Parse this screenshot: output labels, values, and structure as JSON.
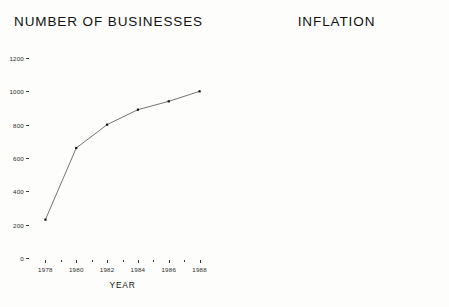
{
  "page": {
    "background_color": "#fdfdfb",
    "ink_color": "#1a1a1a"
  },
  "charts": {
    "left": {
      "title": "NUMBER OF BUSINESSES",
      "xlabel": "YEAR",
      "ylabel": ""
    },
    "right": {
      "title": "INFLATION",
      "xlabel": "YEAR",
      "ylabel": ""
    }
  },
  "chart_data": [
    {
      "type": "line",
      "title": "NUMBER OF BUSINESSES",
      "xlabel": "YEAR",
      "ylabel": "",
      "x": [
        1978,
        1980,
        1982,
        1984,
        1986,
        1988
      ],
      "values": [
        230,
        660,
        800,
        890,
        940,
        1000
      ],
      "xtick_labels": [
        "1978",
        "1980",
        "1982",
        "1984",
        "1986",
        "1988"
      ],
      "ytick_labels": [
        "0",
        "200",
        "400",
        "600",
        "800",
        "1000",
        "1200"
      ],
      "ytick_values": [
        0,
        200,
        400,
        600,
        800,
        1000,
        1200
      ],
      "xlim": [
        1977,
        1989
      ],
      "ylim": [
        0,
        1200
      ],
      "grid": false,
      "legend": "none",
      "marker": "square",
      "line_color": "#333333"
    },
    {
      "type": "line",
      "title": "INFLATION",
      "xlabel": "YEAR",
      "ylabel": "",
      "x": [
        1976,
        1977,
        1978,
        1979,
        1980,
        1981,
        1982,
        1983,
        1984,
        1985,
        1986,
        1987,
        1988
      ],
      "values": [
        24.0,
        16.9,
        8.9,
        15.3,
        16.1,
        19.5,
        8.7,
        9.3,
        13.2,
        10.9,
        10.1,
        10.0,
        5.1
      ],
      "xtick_labels": [
        "1976",
        "1978",
        "1980",
        "1982",
        "1984",
        "1986",
        "1988"
      ],
      "xtick_values": [
        1976,
        1978,
        1980,
        1982,
        1984,
        1986,
        1988
      ],
      "ytick_labels": [
        "0%",
        "5%",
        "10%",
        "15%",
        "20%",
        "25%",
        "30%"
      ],
      "ytick_values": [
        0,
        5,
        10,
        15,
        20,
        25,
        30
      ],
      "xlim": [
        1975.5,
        1988.8
      ],
      "ylim": [
        0,
        30
      ],
      "grid": false,
      "legend": "none",
      "marker": "square",
      "line_color": "#333333"
    }
  ]
}
